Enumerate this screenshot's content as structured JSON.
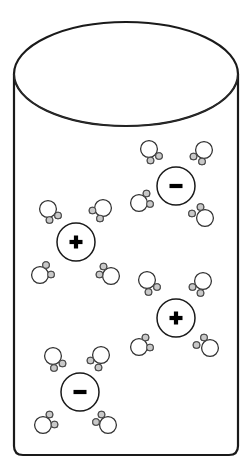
{
  "figure": {
    "background_color": "#ffffff",
    "outline_color": "#1a1a1a"
  },
  "container": {
    "name": "beaker",
    "shape": "cylinder",
    "left": 14,
    "right": 238,
    "top_ellipse_cy": 74,
    "top_ellipse_rx": 112,
    "top_ellipse_ry": 52,
    "bottom_y": 455,
    "corner_radius": 9,
    "stroke_width": 2.2
  },
  "legend": {
    "oxygen_label": "O",
    "hydrogen_label": "H",
    "oxygen_color": "#ffffff",
    "hydrogen_color": "#c9c9c9",
    "positive_sign": "+",
    "negative_sign": "-"
  },
  "counts": {
    "positive_ions": 2,
    "negative_ions": 2,
    "water_molecules": 16,
    "total_particles": 20
  },
  "ions": [
    {
      "id": "ion-negative-1",
      "charge": "negative",
      "sign": "-",
      "cx": 176,
      "cy": 186,
      "r": 19,
      "shell_waters": 4
    },
    {
      "id": "ion-positive-1",
      "charge": "positive",
      "sign": "+",
      "cx": 76,
      "cy": 242,
      "r": 19,
      "shell_waters": 4
    },
    {
      "id": "ion-positive-2",
      "charge": "positive",
      "sign": "+",
      "cx": 176,
      "cy": 318,
      "r": 19,
      "shell_waters": 4
    },
    {
      "id": "ion-negative-2",
      "charge": "negative",
      "sign": "-",
      "cx": 80,
      "cy": 392,
      "r": 19,
      "shell_waters": 4
    }
  ],
  "waters": [
    {
      "id": "water-1",
      "shell_of": "ion-negative-1",
      "ox": 149,
      "oy": 149,
      "or": 8.4,
      "h": [
        {
          "x": 159.0,
          "y": 156.0,
          "r": 3.3
        },
        {
          "x": 150.5,
          "y": 160.5,
          "r": 3.3
        }
      ]
    },
    {
      "id": "water-2",
      "shell_of": "ion-negative-1",
      "ox": 204,
      "oy": 150,
      "or": 8.4,
      "h": [
        {
          "x": 193.5,
          "y": 156.5,
          "r": 3.3
        },
        {
          "x": 202.0,
          "y": 161.5,
          "r": 3.3
        }
      ]
    },
    {
      "id": "water-3",
      "shell_of": "ion-negative-1",
      "ox": 139,
      "oy": 203,
      "or": 8.4,
      "h": [
        {
          "x": 146.5,
          "y": 193.5,
          "r": 3.3
        },
        {
          "x": 150.0,
          "y": 204.0,
          "r": 3.3
        }
      ]
    },
    {
      "id": "water-4",
      "shell_of": "ion-negative-1",
      "ox": 205,
      "oy": 218,
      "or": 8.4,
      "h": [
        {
          "x": 200.5,
          "y": 207.0,
          "r": 3.3
        },
        {
          "x": 192.0,
          "y": 213.5,
          "r": 3.3
        }
      ]
    },
    {
      "id": "water-5",
      "shell_of": "ion-positive-1",
      "ox": 48,
      "oy": 209,
      "or": 8.4,
      "h": [
        {
          "x": 58.0,
          "y": 215.5,
          "r": 3.3
        },
        {
          "x": 49.5,
          "y": 220.0,
          "r": 3.3
        }
      ]
    },
    {
      "id": "water-6",
      "shell_of": "ion-positive-1",
      "ox": 103,
      "oy": 208,
      "or": 8.4,
      "h": [
        {
          "x": 92.5,
          "y": 210.5,
          "r": 3.3
        },
        {
          "x": 100.0,
          "y": 218.5,
          "r": 3.3
        }
      ]
    },
    {
      "id": "water-7",
      "shell_of": "ion-positive-1",
      "ox": 40,
      "oy": 275,
      "or": 8.4,
      "h": [
        {
          "x": 46.0,
          "y": 265.0,
          "r": 3.3
        },
        {
          "x": 51.0,
          "y": 274.5,
          "r": 3.3
        }
      ]
    },
    {
      "id": "water-8",
      "shell_of": "ion-positive-1",
      "ox": 111,
      "oy": 276,
      "or": 8.4,
      "h": [
        {
          "x": 103.5,
          "y": 266.5,
          "r": 3.3
        },
        {
          "x": 99.5,
          "y": 274.5,
          "r": 3.3
        }
      ]
    },
    {
      "id": "water-9",
      "shell_of": "ion-positive-2",
      "ox": 147,
      "oy": 280,
      "or": 8.4,
      "h": [
        {
          "x": 157.0,
          "y": 287.0,
          "r": 3.3
        },
        {
          "x": 148.5,
          "y": 292.0,
          "r": 3.3
        }
      ]
    },
    {
      "id": "water-10",
      "shell_of": "ion-positive-2",
      "ox": 203,
      "oy": 281,
      "or": 8.4,
      "h": [
        {
          "x": 192.5,
          "y": 287.0,
          "r": 3.3
        },
        {
          "x": 200.5,
          "y": 293.0,
          "r": 3.3
        }
      ]
    },
    {
      "id": "water-11",
      "shell_of": "ion-positive-2",
      "ox": 139,
      "oy": 347,
      "or": 8.4,
      "h": [
        {
          "x": 145.5,
          "y": 337.5,
          "r": 3.3
        },
        {
          "x": 150.0,
          "y": 347.5,
          "r": 3.3
        }
      ]
    },
    {
      "id": "water-12",
      "shell_of": "ion-positive-2",
      "ox": 210,
      "oy": 348,
      "or": 8.4,
      "h": [
        {
          "x": 204.0,
          "y": 337.5,
          "r": 3.3
        },
        {
          "x": 196.5,
          "y": 345.0,
          "r": 3.3
        }
      ]
    },
    {
      "id": "water-13",
      "shell_of": "ion-negative-2",
      "ox": 53,
      "oy": 356,
      "or": 8.4,
      "h": [
        {
          "x": 62.5,
          "y": 363.5,
          "r": 3.3
        },
        {
          "x": 54.0,
          "y": 368.0,
          "r": 3.3
        }
      ]
    },
    {
      "id": "water-14",
      "shell_of": "ion-negative-2",
      "ox": 101,
      "oy": 355,
      "or": 8.4,
      "h": [
        {
          "x": 90.5,
          "y": 360.5,
          "r": 3.3
        },
        {
          "x": 98.5,
          "y": 367.5,
          "r": 3.3
        }
      ]
    },
    {
      "id": "water-15",
      "shell_of": "ion-negative-2",
      "ox": 43,
      "oy": 425,
      "or": 8.4,
      "h": [
        {
          "x": 49.5,
          "y": 414.5,
          "r": 3.3
        },
        {
          "x": 54.5,
          "y": 424.5,
          "r": 3.3
        }
      ]
    },
    {
      "id": "water-16",
      "shell_of": "ion-negative-2",
      "ox": 108,
      "oy": 425,
      "or": 8.4,
      "h": [
        {
          "x": 101.5,
          "y": 414.5,
          "r": 3.3
        },
        {
          "x": 96.0,
          "y": 422.0,
          "r": 3.3
        }
      ]
    }
  ]
}
